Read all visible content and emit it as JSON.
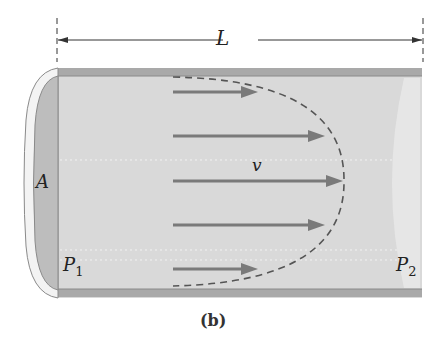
{
  "figure": {
    "caption": "(b)",
    "length_label": "L",
    "area_label": "A",
    "velocity_label": "v",
    "pressure_left": {
      "base": "P",
      "sub": "1"
    },
    "pressure_right": {
      "base": "P",
      "sub": "2"
    },
    "colors": {
      "pipe_fill": "#d9d9d9",
      "pipe_wall": "#a9a9a9",
      "end_cap": "#bdbdbd",
      "arrow": "#7a7a7a",
      "profile_dash": "#555555",
      "dimension_line": "#333333"
    },
    "velocity_arrows": [
      {
        "y": 92,
        "x1": 173,
        "x2": 258
      },
      {
        "y": 136,
        "x1": 173,
        "x2": 325
      },
      {
        "y": 181,
        "x1": 173,
        "x2": 343
      },
      {
        "y": 225,
        "x1": 173,
        "x2": 325
      },
      {
        "y": 269,
        "x1": 173,
        "x2": 258
      }
    ]
  }
}
